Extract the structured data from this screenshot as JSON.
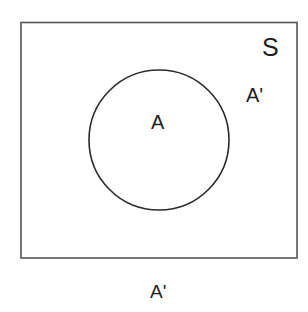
{
  "diagram": {
    "type": "venn",
    "universal_set": {
      "label": "S",
      "stroke_color": "#555555"
    },
    "set_a": {
      "label": "A",
      "stroke_color": "#2a2a2a"
    },
    "complement_labels": {
      "inside_right": "A'",
      "below": "A'"
    }
  }
}
